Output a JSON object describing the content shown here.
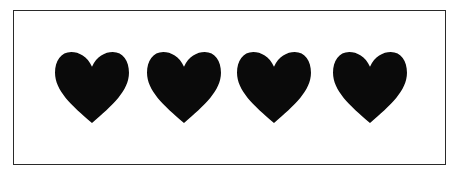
{
  "figure": {
    "heart_count": 4,
    "heart_color": "#0a0a0a",
    "frame_color": "#2a2a2a",
    "hearts": [
      {
        "index": 1,
        "x": 55
      },
      {
        "index": 2,
        "x": 147
      },
      {
        "index": 3,
        "x": 237
      },
      {
        "index": 4,
        "x": 333
      }
    ]
  }
}
